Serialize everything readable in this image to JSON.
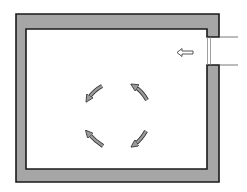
{
  "diagram": {
    "type": "floor-plan-airflow",
    "room": {
      "outer": {
        "x": 16,
        "y": 14,
        "w": 203,
        "h": 168
      },
      "inner": {
        "x": 26,
        "y": 29,
        "w": 181,
        "h": 140
      },
      "wall_fill": "#a6a6a6",
      "wall_stroke": "#1a1a1a"
    },
    "opening": {
      "side": "right",
      "y_top": 36,
      "y_bottom": 65,
      "duct_line_end_x": 237
    },
    "inlet_arrow": {
      "direction": "left",
      "x": 185,
      "y": 52
    },
    "circulation": {
      "direction": "counter-clockwise",
      "arrow_count": 4,
      "arrow_color": "#9a9a9a"
    }
  }
}
